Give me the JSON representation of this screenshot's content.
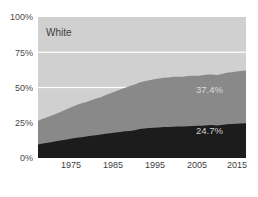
{
  "chart_data": {
    "type": "area",
    "stacked": true,
    "title": "White",
    "xlabel": "",
    "ylabel": "",
    "xlim": [
      1972,
      2015
    ],
    "ylim": [
      0,
      100
    ],
    "grid": true,
    "gridlines": [
      25,
      50,
      75
    ],
    "legend_position": "none",
    "x_tick_labels": [
      "1975",
      "1985",
      "1995",
      "2005",
      "2015"
    ],
    "x_tick_values": [
      1975,
      1985,
      1995,
      2005,
      2015
    ],
    "y_tick_labels": [
      "0%",
      "25%",
      "50%",
      "75%",
      "100%"
    ],
    "y_tick_values": [
      0,
      25,
      50,
      75,
      100
    ],
    "colors": {
      "background": "#ffffff",
      "plot_background": "#e3e3e3",
      "series_top": "#d0d0d0",
      "series_middle": "#898989",
      "series_bottom": "#1c1c1c",
      "gridline": "#ffffff",
      "axis_text": "#4a4a4a"
    },
    "x": [
      1972,
      1973,
      1974,
      1975,
      1976,
      1977,
      1978,
      1979,
      1980,
      1981,
      1982,
      1983,
      1984,
      1985,
      1986,
      1987,
      1988,
      1989,
      1990,
      1991,
      1992,
      1993,
      1994,
      1995,
      1996,
      1997,
      1998,
      1999,
      2000,
      2001,
      2002,
      2003,
      2004,
      2005,
      2006,
      2007,
      2008,
      2009,
      2010,
      2011,
      2012,
      2013,
      2014,
      2015
    ],
    "series": [
      {
        "name": "bottom",
        "color": "#1c1c1c",
        "end_label": "24.7%",
        "values": [
          9.5,
          10.2,
          10.8,
          11.4,
          12.0,
          12.6,
          13.2,
          13.9,
          14.4,
          14.8,
          15.3,
          15.7,
          16.2,
          16.6,
          17.2,
          17.6,
          18.0,
          18.4,
          18.9,
          19.2,
          19.6,
          20.6,
          20.9,
          21.2,
          21.5,
          21.7,
          21.9,
          22.0,
          22.2,
          22.4,
          22.3,
          22.5,
          22.7,
          22.8,
          22.9,
          23.2,
          23.4,
          23.1,
          23.4,
          23.9,
          24.1,
          24.3,
          24.5,
          24.7
        ]
      },
      {
        "name": "middle",
        "color": "#898989",
        "end_label": "37.4%",
        "values": [
          17.0,
          17.6,
          18.3,
          19.0,
          19.8,
          20.6,
          21.5,
          22.3,
          23.2,
          24.0,
          24.4,
          25.2,
          26.0,
          26.4,
          27.5,
          28.3,
          29.2,
          30.2,
          31.0,
          31.8,
          32.5,
          33.0,
          33.6,
          34.0,
          34.3,
          34.6,
          35.0,
          35.1,
          35.4,
          35.2,
          35.4,
          35.6,
          35.6,
          35.5,
          35.8,
          36.0,
          35.9,
          35.8,
          36.2,
          36.5,
          36.8,
          37.0,
          37.2,
          37.4
        ]
      }
    ],
    "annotations": [
      {
        "text": "White",
        "position": "inside-top-left"
      },
      {
        "text": "37.4%",
        "position": "inside-right-middle"
      },
      {
        "text": "24.7%",
        "position": "inside-right-lower"
      }
    ]
  },
  "axes": {
    "y_ticks": [
      {
        "label": "100%",
        "value": 100
      },
      {
        "label": "75%",
        "value": 75
      },
      {
        "label": "50%",
        "value": 50
      },
      {
        "label": "25%",
        "value": 25
      },
      {
        "label": "0%",
        "value": 0
      }
    ],
    "x_ticks": [
      {
        "label": "1975",
        "value": 1975
      },
      {
        "label": "1985",
        "value": 1985
      },
      {
        "label": "1995",
        "value": 1995
      },
      {
        "label": "2005",
        "value": 2005
      },
      {
        "label": "2015",
        "value": 2015
      }
    ]
  },
  "labels": {
    "series_title": "White",
    "middle_value": "37.4%",
    "bottom_value": "24.7%"
  }
}
